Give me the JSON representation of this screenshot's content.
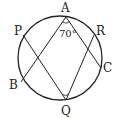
{
  "diagram": {
    "type": "circle-geometry",
    "circle": {
      "cx": 60,
      "cy": 58,
      "r": 42
    },
    "points": {
      "A": {
        "label": "A",
        "x": 66,
        "y": 17
      },
      "P": {
        "label": "P",
        "x": 23,
        "y": 35
      },
      "B": {
        "label": "B",
        "x": 21,
        "y": 82
      },
      "Q": {
        "label": "Q",
        "x": 66,
        "y": 100
      },
      "R": {
        "label": "R",
        "x": 94,
        "y": 35
      },
      "C": {
        "label": "C",
        "x": 101,
        "y": 68
      }
    },
    "segments": [
      [
        "A",
        "B"
      ],
      [
        "A",
        "C"
      ],
      [
        "P",
        "Q"
      ],
      [
        "R",
        "Q"
      ]
    ],
    "angle_label": "70°",
    "angle_marks": [
      "A",
      "Q"
    ],
    "stroke_color": "#222222"
  }
}
